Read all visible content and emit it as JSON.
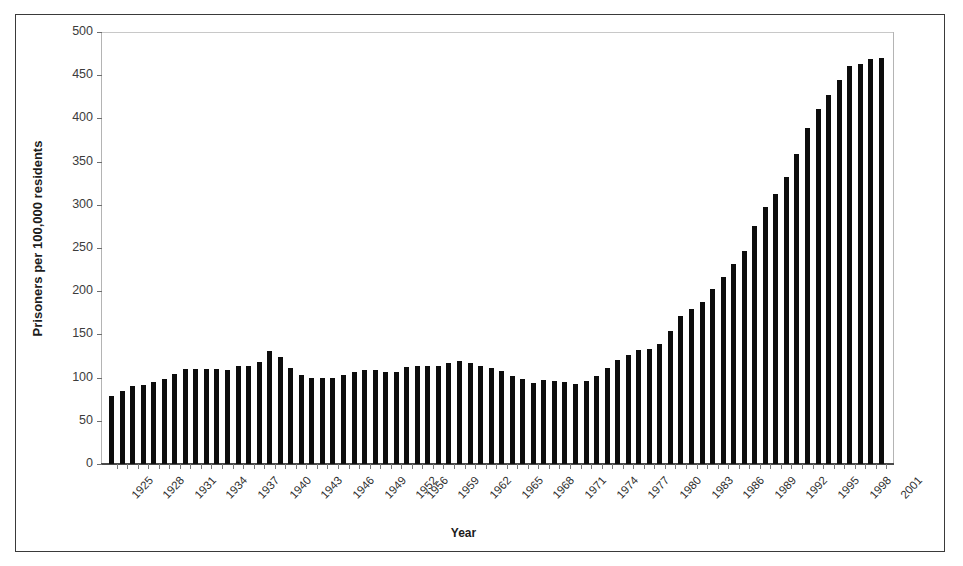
{
  "chart_data": {
    "type": "bar",
    "title": "",
    "xlabel": "Year",
    "ylabel": "Prisoners per 100,000 residents",
    "ylim": [
      0,
      500
    ],
    "ytick_labels": [
      "0",
      "50",
      "100",
      "150",
      "200",
      "250",
      "300",
      "350",
      "400",
      "450",
      "500"
    ],
    "ytick_values": [
      0,
      50,
      100,
      150,
      200,
      250,
      300,
      350,
      400,
      450,
      500
    ],
    "grid": false,
    "legend": "none",
    "bar_color": "#0d0d0d",
    "xtick_label_interval": 3,
    "xtick_labels_shown": [
      "1925",
      "1928",
      "1931",
      "1934",
      "1937",
      "1940",
      "1943",
      "1946",
      "1949",
      "1952",
      "1956",
      "1959",
      "1962",
      "1965",
      "1968",
      "1971",
      "1974",
      "1977",
      "1980",
      "1983",
      "1986",
      "1989",
      "1992",
      "1995",
      "1998",
      "2001"
    ],
    "categories": [
      "1925",
      "1926",
      "1927",
      "1928",
      "1929",
      "1930",
      "1931",
      "1932",
      "1933",
      "1934",
      "1935",
      "1936",
      "1937",
      "1938",
      "1939",
      "1940",
      "1941",
      "1942",
      "1943",
      "1944",
      "1945",
      "1946",
      "1947",
      "1948",
      "1949",
      "1950",
      "1951",
      "1952",
      "1956",
      "1957",
      "1958",
      "1959",
      "1960",
      "1961",
      "1962",
      "1963",
      "1964",
      "1965",
      "1966",
      "1967",
      "1968",
      "1969",
      "1970",
      "1971",
      "1972",
      "1973",
      "1974",
      "1975",
      "1976",
      "1977",
      "1978",
      "1979",
      "1980",
      "1981",
      "1982",
      "1983",
      "1984",
      "1985",
      "1986",
      "1987",
      "1988",
      "1989",
      "1990",
      "1991",
      "1992",
      "1993",
      "1994",
      "1995",
      "1996",
      "1997",
      "1998",
      "1999",
      "2000",
      "2001"
    ],
    "values": [
      79,
      85,
      90,
      92,
      95,
      98,
      104,
      110,
      110,
      110,
      110,
      109,
      113,
      113,
      118,
      131,
      124,
      111,
      103,
      100,
      99,
      99,
      103,
      106,
      109,
      109,
      107,
      107,
      112,
      113,
      113,
      114,
      117,
      119,
      117,
      114,
      111,
      108,
      102,
      98,
      94,
      97,
      96,
      95,
      93,
      96,
      102,
      111,
      120,
      126,
      132,
      133,
      139,
      154,
      171,
      179,
      188,
      202,
      217,
      231,
      247,
      276,
      297,
      313,
      332,
      359,
      389,
      411,
      427,
      445,
      461,
      463,
      469,
      470
    ]
  },
  "figure": {
    "background": "#ffffff",
    "border_color": "#3a3a3a"
  }
}
